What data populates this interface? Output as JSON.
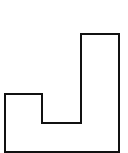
{
  "diagram": {
    "shape": "rectilinear-polygon",
    "stroke_color": "#111111",
    "fill_color": "#ffffff",
    "stroke_width": 2,
    "points": "5,152 5,94 42,94 42,123 81,123 81,34 119,34 119,152"
  }
}
